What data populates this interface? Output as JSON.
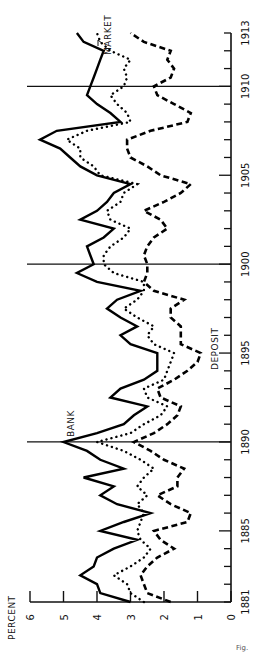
{
  "chart_data": {
    "type": "line",
    "orientation": "rotated-90-ccw",
    "title": "",
    "xlabel": "",
    "ylabel": "PERCENT",
    "xlim": [
      1881,
      1913
    ],
    "ylim": [
      0,
      6
    ],
    "x_ticks": [
      1881,
      1885,
      1890,
      1895,
      1900,
      1905,
      1910,
      1913
    ],
    "y_ticks": [
      0,
      1,
      2,
      3,
      4,
      5,
      6
    ],
    "vertical_reference_lines": [
      1890,
      1900,
      1910
    ],
    "grid": false,
    "legend": "inline labels",
    "x": [
      1881,
      1881.5,
      1882,
      1882.5,
      1883,
      1883.5,
      1884,
      1884.5,
      1885,
      1885.5,
      1886,
      1886.5,
      1887,
      1887.5,
      1888,
      1888.5,
      1889,
      1889.5,
      1890,
      1890.5,
      1891,
      1891.5,
      1892,
      1892.5,
      1893,
      1893.5,
      1894,
      1894.5,
      1895,
      1895.5,
      1896,
      1896.5,
      1897,
      1897.5,
      1898,
      1898.5,
      1899,
      1899.5,
      1900,
      1900.5,
      1901,
      1901.5,
      1902,
      1902.5,
      1903,
      1903.5,
      1904,
      1904.5,
      1905,
      1905.5,
      1906,
      1906.5,
      1907,
      1907.5,
      1908,
      1908.5,
      1909,
      1909.5,
      1910,
      1910.5,
      1911,
      1911.5,
      1912,
      1912.5,
      1913
    ],
    "series": [
      {
        "name": "BANK",
        "style": "solid",
        "values": [
          3.0,
          3.9,
          4.0,
          4.5,
          4.1,
          4.0,
          3.5,
          2.8,
          3.9,
          3.2,
          2.4,
          3.4,
          3.9,
          3.5,
          4.4,
          3.2,
          3.9,
          4.3,
          5.0,
          4.0,
          3.2,
          2.9,
          2.5,
          3.6,
          3.3,
          2.6,
          2.2,
          2.2,
          2.2,
          3.0,
          3.3,
          2.8,
          3.3,
          3.7,
          3.4,
          2.7,
          4.0,
          4.6,
          4.1,
          4.2,
          4.3,
          3.8,
          3.5,
          4.5,
          4.0,
          3.7,
          3.5,
          3.0,
          4.0,
          4.5,
          4.8,
          5.1,
          5.7,
          5.2,
          3.3,
          3.6,
          4.0,
          4.3,
          4.2,
          4.1,
          4.0,
          3.9,
          3.8,
          4.4,
          4.6
        ]
      },
      {
        "name": "DEPOSIT",
        "style": "dashed",
        "values": [
          1.8,
          2.5,
          2.6,
          2.7,
          2.5,
          2.2,
          1.7,
          2.1,
          2.3,
          1.3,
          1.2,
          1.8,
          2.2,
          1.6,
          1.6,
          1.4,
          2.0,
          2.4,
          2.9,
          2.3,
          1.9,
          1.6,
          1.5,
          2.1,
          2.2,
          1.7,
          1.3,
          1.0,
          0.9,
          1.5,
          1.5,
          1.5,
          1.8,
          1.8,
          1.4,
          2.3,
          2.6,
          2.5,
          2.5,
          2.6,
          2.5,
          2.3,
          1.9,
          2.1,
          2.6,
          2.0,
          1.5,
          1.2,
          2.1,
          2.5,
          3.0,
          3.1,
          3.1,
          2.4,
          1.3,
          1.2,
          1.7,
          2.2,
          2.3,
          1.8,
          1.7,
          1.9,
          1.8,
          2.6,
          3.0
        ]
      },
      {
        "name": "MARKET",
        "style": "dotted",
        "values": [
          2.6,
          3.0,
          3.1,
          3.5,
          3.0,
          2.6,
          2.4,
          2.7,
          2.8,
          2.7,
          2.6,
          2.8,
          2.5,
          2.8,
          2.6,
          2.3,
          2.7,
          3.2,
          4.0,
          3.0,
          2.6,
          2.1,
          1.9,
          2.5,
          2.6,
          2.0,
          1.9,
          1.8,
          1.7,
          2.3,
          2.5,
          2.3,
          2.8,
          3.2,
          2.8,
          2.6,
          2.6,
          3.5,
          3.8,
          3.8,
          3.6,
          3.2,
          3.0,
          3.6,
          3.7,
          3.3,
          3.2,
          2.8,
          3.9,
          4.1,
          4.5,
          4.5,
          4.9,
          4.3,
          3.0,
          3.1,
          3.4,
          3.6,
          3.2,
          3.1,
          3.2,
          3.0,
          3.6,
          3.9,
          4.0
        ]
      }
    ],
    "annotations": [
      {
        "text": "BANK",
        "at_year": 1890
      },
      {
        "text": "DEPOSIT",
        "at_year": 1896.5
      },
      {
        "text": "MARKET",
        "at_year": 1912.5
      }
    ]
  },
  "labels": {
    "ylabel": "PERCENT",
    "bank": "BANK",
    "deposit": "DEPOSIT",
    "market": "MARKET",
    "corner": "Fig."
  }
}
